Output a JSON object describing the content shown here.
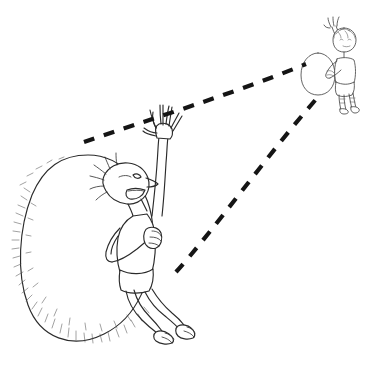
{
  "artwork": {
    "title": "Perspective sketch: near figure with large egg and far figure with small egg",
    "medium": "pen-and-ink line drawing",
    "background_color": "#ffffff",
    "ink_color": "#2b2b2b",
    "dash_color": "#151515",
    "canvas": {
      "width": 376,
      "height": 366
    },
    "caption": ""
  },
  "scene": {
    "near_group": {
      "label": "near figure beside large egg",
      "egg": {
        "name": "large egg",
        "center_x": 88,
        "center_y": 243,
        "radius_x": 65,
        "radius_y": 88,
        "shading": "fine hatching along lower-left rim"
      },
      "figure": {
        "name": "near standing figure",
        "pose": "left arm raised waving, right hand gripping, legs crossed",
        "head_x": 130,
        "head_y": 182,
        "height_px": 175,
        "feet_y": 336,
        "barefoot": true
      }
    },
    "far_group": {
      "label": "far figure beside small egg",
      "egg": {
        "name": "small egg",
        "center_x": 318,
        "center_y": 74,
        "radius_x": 17,
        "radius_y": 21,
        "shading": "plain outline"
      },
      "figure": {
        "name": "far standing figure",
        "pose": "one arm raised waving",
        "head_x": 344,
        "head_y": 37,
        "height_px": 75,
        "feet_y": 108,
        "barefoot": true
      }
    },
    "sight_lines": [
      {
        "name": "upper sight line",
        "from_x": 84,
        "from_y": 142,
        "to_x": 306,
        "to_y": 64,
        "style": "dashed",
        "dash_length": 11,
        "dash_gap": 10
      },
      {
        "name": "lower sight line",
        "from_x": 176,
        "from_y": 272,
        "to_x": 318,
        "to_y": 97,
        "style": "dashed",
        "dash_length": 11,
        "dash_gap": 10
      }
    ]
  }
}
